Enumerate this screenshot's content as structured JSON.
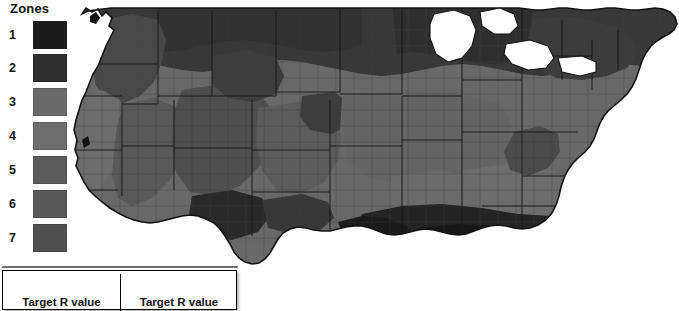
{
  "legend": {
    "title": "Zones",
    "items": [
      {
        "label": "1",
        "color": "#1c1c1c"
      },
      {
        "label": "2",
        "color": "#2e2e2e"
      },
      {
        "label": "3",
        "color": "#6a6a6a"
      },
      {
        "label": "4",
        "color": "#6e6e6e"
      },
      {
        "label": "5",
        "color": "#5a5a5a"
      },
      {
        "label": "6",
        "color": "#585858"
      },
      {
        "label": "7",
        "color": "#4f4f4f"
      }
    ]
  },
  "map": {
    "name": "united-states-climate-zone-map",
    "projection": "conus-albers",
    "background": "#ffffff",
    "outline_color": "#111111",
    "county_line_color": "#3a3a3a",
    "state_line_color": "#1f1f1f",
    "zone_colors": {
      "zone1": "#1c1c1c",
      "zone2": "#2e2e2e",
      "zone3": "#6a6a6a",
      "zone4": "#6e6e6e",
      "zone5": "#5a5a5a",
      "zone6": "#4a4a4a",
      "zone7": "#3a3a3a"
    }
  },
  "rvalue_table": {
    "columns": [
      {
        "header": "Target R value"
      },
      {
        "header": "Target R value"
      }
    ]
  }
}
